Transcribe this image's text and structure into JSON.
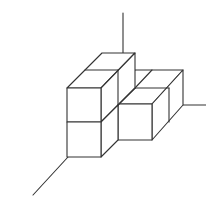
{
  "diagram": {
    "type": "isometric cube arrangement on 3D axes",
    "cube_count_visible_faces": "stacked unit cubes",
    "colors": {
      "stroke": "#333333",
      "background": "#ffffff"
    },
    "axes": [
      {
        "name": "vertical-axis",
        "x1": 123,
        "y1": 13,
        "x2": 123,
        "y2": 53
      },
      {
        "name": "right-axis",
        "x1": 183,
        "y1": 105,
        "x2": 206,
        "y2": 105
      },
      {
        "name": "left-axis",
        "x1": 68,
        "y1": 157,
        "x2": 33,
        "y2": 195
      }
    ]
  }
}
